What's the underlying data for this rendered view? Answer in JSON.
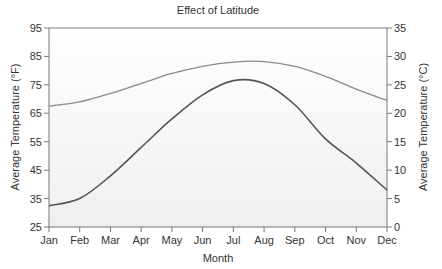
{
  "chart_data": {
    "type": "line",
    "title": "Effect of Latitude",
    "xlabel": "Month",
    "ylabel": "Average Temperature (°F)",
    "ylabel_right": "Average Temperature (°C)",
    "categories": [
      "Jan",
      "Feb",
      "Mar",
      "Apr",
      "May",
      "Jun",
      "Jul",
      "Aug",
      "Sep",
      "Oct",
      "Nov",
      "Dec"
    ],
    "ylim": [
      25,
      95
    ],
    "ylim_right": [
      0,
      35
    ],
    "yticks": [
      25,
      35,
      45,
      55,
      65,
      75,
      85,
      95
    ],
    "yticks_right": [
      0,
      5,
      10,
      15,
      20,
      25,
      30,
      35
    ],
    "grid": false,
    "legend": null,
    "series": [
      {
        "name": "Upper curve (smaller annual range)",
        "values": [
          67.5,
          69,
          72,
          75.5,
          79,
          81.5,
          83,
          83.2,
          81.5,
          78,
          73.5,
          69.5
        ]
      },
      {
        "name": "Lower curve (larger annual range)",
        "values": [
          32.5,
          35,
          43,
          53,
          63,
          71.5,
          76.5,
          75.5,
          68,
          56,
          47.5,
          38
        ]
      }
    ]
  },
  "colors": {
    "upper_line": "#8a8a8a",
    "lower_line": "#555555",
    "axis": "#777777",
    "text": "#333333",
    "plot_bg_top": "#ffffff",
    "plot_bg_bottom": "#efefef"
  }
}
